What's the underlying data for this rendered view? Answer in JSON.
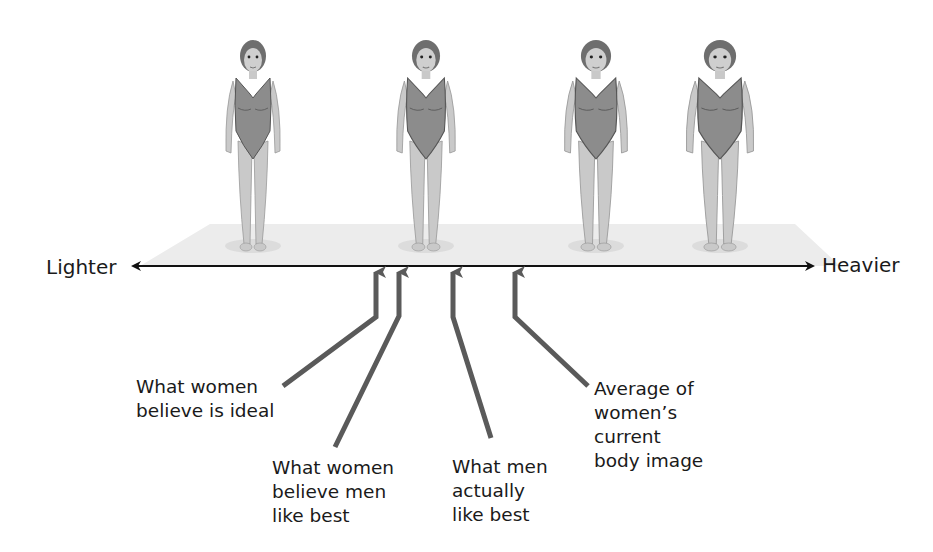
{
  "axis": {
    "left_label": "Lighter",
    "right_label": "Heavier"
  },
  "figures": [
    {
      "name": "figure-1-thinnest",
      "x": 253,
      "build": 1.0
    },
    {
      "name": "figure-2",
      "x": 426,
      "build": 1.08
    },
    {
      "name": "figure-3",
      "x": 596,
      "build": 1.16
    },
    {
      "name": "figure-4-heaviest",
      "x": 720,
      "build": 1.24
    }
  ],
  "annotations": [
    {
      "id": "women-ideal",
      "text": "What women\nbelieve is ideal",
      "axis_x": 375
    },
    {
      "id": "women-believe-men-like",
      "text": "What women\nbelieve men\nlike best",
      "axis_x": 399
    },
    {
      "id": "men-actually-like",
      "text": "What men\nactually\nlike best",
      "axis_x": 453
    },
    {
      "id": "women-current",
      "text": "Average of\nwomen’s\ncurrent\nbody image",
      "axis_x": 516
    }
  ],
  "colors": {
    "arrow": "#5a5a5a",
    "axis": "#111111",
    "platform": "#ececec",
    "suit": "#8c8c8c",
    "skin": "#c9c9c9",
    "hair": "#6e6e6e"
  }
}
